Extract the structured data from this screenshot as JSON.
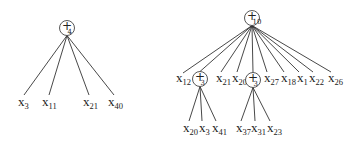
{
  "trees": [
    {
      "name": "tree-left",
      "root": {
        "op": "+",
        "arity": "4"
      },
      "leaves": [
        {
          "var": "x",
          "index": "3"
        },
        {
          "var": "x",
          "index": "11"
        },
        {
          "var": "x",
          "index": "21"
        },
        {
          "var": "x",
          "index": "40"
        }
      ]
    },
    {
      "name": "tree-right",
      "root": {
        "op": "+",
        "arity": "10"
      },
      "children": [
        {
          "var": "x",
          "index": "12"
        },
        {
          "op": "+",
          "arity": "3",
          "leaves": [
            {
              "var": "x",
              "index": "20"
            },
            {
              "var": "x",
              "index": "3"
            },
            {
              "var": "x",
              "index": "41"
            }
          ]
        },
        {
          "var": "x",
          "index": "21"
        },
        {
          "var": "x",
          "index": "20"
        },
        {
          "op": "+",
          "arity": "3",
          "leaves": [
            {
              "var": "x",
              "index": "37"
            },
            {
              "var": "x",
              "index": "31"
            },
            {
              "var": "x",
              "index": "23"
            }
          ]
        },
        {
          "var": "x",
          "index": "27"
        },
        {
          "var": "x",
          "index": "18"
        },
        {
          "var": "x",
          "index": "1"
        },
        {
          "var": "x",
          "index": "22"
        },
        {
          "var": "x",
          "index": "26"
        }
      ]
    }
  ]
}
